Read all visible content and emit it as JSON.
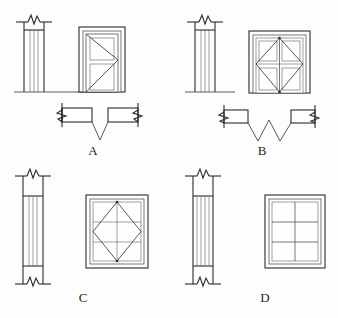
{
  "sheet": {
    "title": "Architectural Door and Window Symbols",
    "background_color": "#fdfdfd",
    "line_color": "#2b2b2b",
    "width": 338,
    "height": 318
  },
  "figures": [
    {
      "key": "A",
      "label": "A",
      "label_x": 93,
      "label_y": 155,
      "caption": "Single swing door",
      "views": [
        "section",
        "elevation",
        "plan"
      ],
      "section": {
        "name": "wall-section-a",
        "break_symbol": "top",
        "vertical_lines": 4,
        "x": 23,
        "y": 22,
        "width": 22,
        "height": 70
      },
      "elevation": {
        "name": "door-elevation-a",
        "type": "single-door",
        "panels": 2,
        "swing_lines": "right-hinge-chevron",
        "x": 79,
        "y": 26,
        "width": 46,
        "height": 66
      },
      "plan": {
        "name": "door-plan-a",
        "type": "single-leaf-v-swing",
        "break_symbols": 2,
        "x": 60,
        "y": 102,
        "width": 80,
        "height": 36
      }
    },
    {
      "key": "B",
      "label": "B",
      "label_x": 262,
      "label_y": 155,
      "caption": "Double swing door",
      "views": [
        "section",
        "elevation",
        "plan"
      ],
      "section": {
        "name": "wall-section-b",
        "break_symbol": "top",
        "vertical_lines": 4,
        "x": 194,
        "y": 22,
        "width": 22,
        "height": 70
      },
      "elevation": {
        "name": "door-elevation-b",
        "type": "double-door",
        "panes": 4,
        "mullion": "cross",
        "swing_lines": "diamond",
        "x": 249,
        "y": 30,
        "width": 60,
        "height": 64
      },
      "plan": {
        "name": "door-plan-b",
        "type": "double-leaf-w-swing",
        "break_symbols": 2,
        "x": 222,
        "y": 104,
        "width": 94,
        "height": 34
      }
    },
    {
      "key": "C",
      "label": "C",
      "label_x": 83,
      "label_y": 302,
      "caption": "Casement window",
      "views": [
        "section",
        "elevation"
      ],
      "section": {
        "name": "window-section-c",
        "break_symbol": "top-and-bottom",
        "vertical_lines": 4,
        "x": 22,
        "y": 176,
        "width": 22,
        "height": 108
      },
      "elevation": {
        "name": "window-elevation-c",
        "type": "window",
        "rows": 3,
        "cols": 2,
        "swing_lines": "diamond",
        "x": 86,
        "y": 194,
        "width": 62,
        "height": 74
      }
    },
    {
      "key": "D",
      "label": "D",
      "label_x": 265,
      "label_y": 302,
      "caption": "Fixed window",
      "views": [
        "section",
        "elevation"
      ],
      "section": {
        "name": "window-section-d",
        "break_symbol": "top-and-bottom",
        "vertical_lines": 5,
        "x": 192,
        "y": 176,
        "width": 22,
        "height": 108
      },
      "elevation": {
        "name": "window-elevation-d",
        "type": "window",
        "rows": 3,
        "cols": 2,
        "swing_lines": "none",
        "x": 265,
        "y": 194,
        "width": 60,
        "height": 74
      }
    }
  ],
  "legend": {
    "break_symbol_name": "break-line-symbol",
    "swing_symbol_name": "door-swing-arc",
    "ground_line_name": "ground-line"
  }
}
